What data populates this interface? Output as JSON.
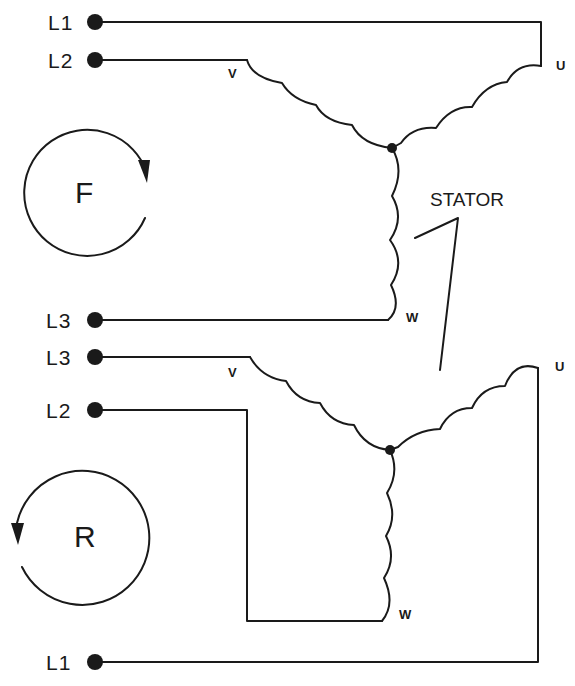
{
  "diagram": {
    "type": "three-phase motor stator wye connection, forward/reverse",
    "stator_label": "STATOR",
    "forward": {
      "rotation_label": "F",
      "rotation_direction": "clockwise",
      "terminals": [
        {
          "label": "L1",
          "connects_to": "U"
        },
        {
          "label": "L2",
          "connects_to": "V"
        },
        {
          "label": "L3",
          "connects_to": "W"
        }
      ],
      "coil_labels": {
        "u": "U",
        "v": "V",
        "w": "W"
      }
    },
    "reverse": {
      "rotation_label": "R",
      "rotation_direction": "counterclockwise",
      "terminals": [
        {
          "label": "L3",
          "connects_to": "V"
        },
        {
          "label": "L2",
          "connects_to": "W"
        },
        {
          "label": "L1",
          "connects_to": "U"
        }
      ],
      "coil_labels": {
        "u": "U",
        "v": "V",
        "w": "W"
      }
    },
    "colors": {
      "ink": "#1a1a1a",
      "background": "#ffffff"
    }
  }
}
